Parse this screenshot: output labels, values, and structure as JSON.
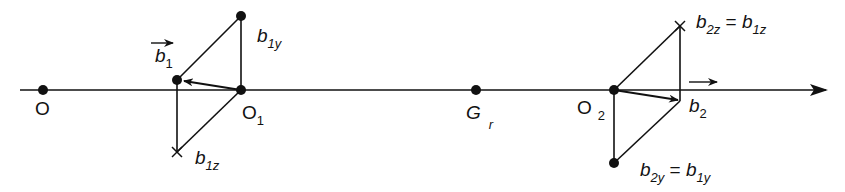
{
  "diagram": {
    "type": "vector-projection-diagram",
    "axis": {
      "direction": "right-arrow"
    },
    "points": [
      {
        "id": "O",
        "label": "O"
      },
      {
        "id": "O1",
        "label": "O",
        "subscript": "1"
      },
      {
        "id": "Gr",
        "label": "G",
        "subscript": "r"
      },
      {
        "id": "O2",
        "label": "O",
        "subscript": "2"
      }
    ],
    "labels": {
      "O": "O",
      "O1_main": "O",
      "O1_sub": "1",
      "Gr_main": "G",
      "Gr_sub": "r",
      "O2_main": "O",
      "O2_sub": "2",
      "b1_main": "b",
      "b1_sub": "1",
      "b1y_main": "b",
      "b1y_sub": "1y",
      "b1z_main": "b",
      "b1z_sub": "1z",
      "b2_main": "b",
      "b2_sub": "2",
      "b2z_main": "b",
      "b2z_sub": "2z",
      "b2z_eq": " = ",
      "b2z_rhs_main": "b",
      "b2z_rhs_sub": "1z",
      "b2y_main": "b",
      "b2y_sub": "2y",
      "b2y_eq": " = ",
      "b2y_rhs_main": "b",
      "b2y_rhs_sub": "1y"
    },
    "colors": {
      "stroke": "#111111",
      "background": "#ffffff"
    }
  }
}
